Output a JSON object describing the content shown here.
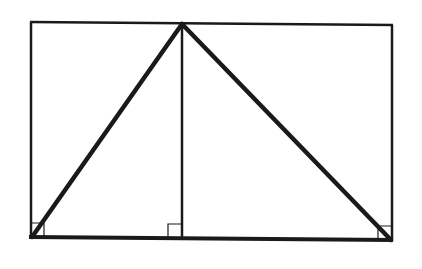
{
  "diagram": {
    "type": "geometry",
    "colors": {
      "stroke": "#1a1a1a",
      "background": "#ffffff"
    },
    "rectangle": {
      "x1": 30,
      "y1": 23,
      "x2": 392,
      "y2": 239
    },
    "apex": {
      "x": 182,
      "y": 24
    },
    "base_left": {
      "x": 31,
      "y": 237
    },
    "base_right": {
      "x": 392,
      "y": 240
    },
    "altitude_foot": {
      "x": 182,
      "y": 238
    },
    "right_angle_markers": [
      {
        "name": "bottom-left",
        "x": 31,
        "y": 237,
        "dir": "right-up"
      },
      {
        "name": "altitude-foot",
        "x": 182,
        "y": 238,
        "dir": "left-up"
      },
      {
        "name": "bottom-right",
        "x": 392,
        "y": 240,
        "dir": "left-up"
      }
    ]
  }
}
